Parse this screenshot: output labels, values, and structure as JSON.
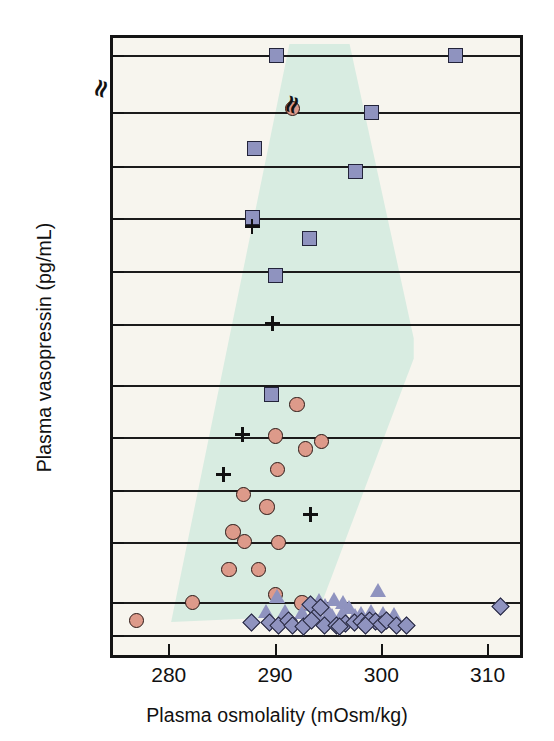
{
  "chart_data": {
    "type": "scatter",
    "title": "",
    "xlabel": "Plasma osmolality (mOsm/kg)",
    "ylabel": "Plasma vasopressin (pg/mL)",
    "xlim": [
      274.8,
      313.0
    ],
    "xticks": [
      280,
      290,
      300,
      310
    ],
    "xtick_labels": [
      "280",
      "290",
      "300",
      "310"
    ],
    "yticks": [
      15,
      10,
      9,
      8,
      7,
      6,
      5,
      4,
      3,
      2,
      1,
      0
    ],
    "ytick_labels": [
      "15",
      "10",
      "9",
      "8",
      "7",
      "6",
      "5",
      "4",
      "3",
      "2",
      "1",
      "LD"
    ],
    "y_axis_note": "broken axis between 10 and 15",
    "y_break_symbol": "≈",
    "grid": "horizontal",
    "legend": "none",
    "background_color": "#f7f5ee",
    "shaded_band_color": "#d8ece1",
    "shaded_band_label": "normal reference range",
    "marker_colors": {
      "square": "#8f93bf",
      "circle": "#dd9a8a",
      "triangle": "#8f93bf",
      "diamond": "#8f93bf",
      "plus": "#111111"
    },
    "series": [
      {
        "name": "squares",
        "marker": "square",
        "points": [
          [
            290.1,
            15.05
          ],
          [
            306.9,
            15.05
          ],
          [
            299.0,
            10.0
          ],
          [
            288.0,
            9.33
          ],
          [
            297.5,
            8.9
          ],
          [
            287.8,
            8.02
          ],
          [
            293.2,
            7.62
          ],
          [
            290.0,
            6.93
          ],
          [
            289.6,
            4.82
          ]
        ]
      },
      {
        "name": "circles",
        "marker": "circle",
        "points": [
          [
            291.6,
            10.35
          ],
          [
            292.0,
            4.63
          ],
          [
            290.0,
            4.03
          ],
          [
            294.3,
            3.92
          ],
          [
            292.8,
            3.78
          ],
          [
            290.2,
            3.4
          ],
          [
            287.0,
            2.92
          ],
          [
            289.2,
            2.68
          ],
          [
            286.0,
            2.2
          ],
          [
            287.1,
            2.02
          ],
          [
            290.3,
            2.0
          ],
          [
            285.6,
            1.55
          ],
          [
            288.4,
            1.55
          ],
          [
            290.0,
            1.13
          ],
          [
            282.2,
            1.0
          ],
          [
            276.9,
            0.45
          ],
          [
            292.5,
            0.98
          ]
        ]
      },
      {
        "name": "plus",
        "marker": "plus",
        "points": [
          [
            287.9,
            7.83
          ],
          [
            289.8,
            6.0
          ],
          [
            287.0,
            4.03
          ],
          [
            285.2,
            3.28
          ],
          [
            293.4,
            2.52
          ]
        ]
      },
      {
        "name": "triangles",
        "marker": "triangle",
        "points": [
          [
            299.7,
            1.2
          ],
          [
            290.2,
            1.1
          ],
          [
            294.2,
            1.02
          ],
          [
            295.6,
            1.05
          ],
          [
            296.4,
            1.0
          ],
          [
            293.5,
            0.92
          ],
          [
            294.7,
            0.9
          ],
          [
            297.0,
            0.82
          ],
          [
            289.2,
            0.72
          ],
          [
            291.0,
            0.72
          ],
          [
            292.6,
            0.68
          ],
          [
            293.9,
            0.66
          ],
          [
            295.0,
            0.66
          ],
          [
            296.3,
            0.66
          ],
          [
            298.1,
            0.66
          ],
          [
            299.1,
            0.7
          ],
          [
            300.2,
            0.64
          ],
          [
            301.2,
            0.62
          ],
          [
            297.6,
            0.6
          ],
          [
            295.4,
            0.58
          ]
        ]
      },
      {
        "name": "diamonds",
        "marker": "diamond",
        "points": [
          [
            311.2,
            0.88
          ],
          [
            293.3,
            0.95
          ],
          [
            294.2,
            0.86
          ],
          [
            287.7,
            0.38
          ],
          [
            289.4,
            0.4
          ],
          [
            290.3,
            0.3
          ],
          [
            291.2,
            0.45
          ],
          [
            291.6,
            0.3
          ],
          [
            292.6,
            0.28
          ],
          [
            293.4,
            0.45
          ],
          [
            294.6,
            0.3
          ],
          [
            295.7,
            0.3
          ],
          [
            296.6,
            0.36
          ],
          [
            297.4,
            0.4
          ],
          [
            298.1,
            0.42
          ],
          [
            298.8,
            0.44
          ],
          [
            299.4,
            0.42
          ],
          [
            300.0,
            0.34
          ],
          [
            300.4,
            0.46
          ],
          [
            301.4,
            0.3
          ],
          [
            302.3,
            0.3
          ],
          [
            296.0,
            0.28
          ],
          [
            298.5,
            0.3
          ]
        ]
      }
    ]
  }
}
